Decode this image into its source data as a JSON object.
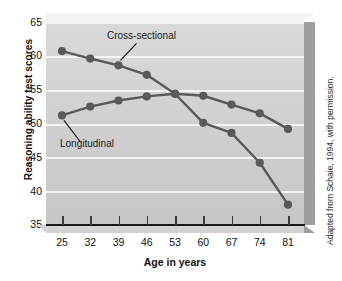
{
  "chart_data": {
    "type": "line",
    "title": "",
    "xlabel": "Age in years",
    "ylabel": "Reasoning ability test scores",
    "x": [
      25,
      32,
      39,
      46,
      53,
      60,
      67,
      74,
      81
    ],
    "xtick_labels": [
      "25",
      "32",
      "39",
      "46",
      "53",
      "60",
      "67",
      "74",
      "81"
    ],
    "ytick_labels": [
      "65",
      "60",
      "55",
      "50",
      "45",
      "40",
      "35"
    ],
    "yticks": [
      65,
      60,
      55,
      50,
      45,
      40,
      35
    ],
    "xlim": [
      25,
      81
    ],
    "ylim": [
      35,
      65
    ],
    "grid": true,
    "legend_position": "inline-annotations",
    "series": [
      {
        "name": "Cross-sectional",
        "values": [
          60.7,
          59.6,
          58.6,
          57.2,
          54.4,
          50.1,
          48.6,
          44.2,
          38.0
        ],
        "color": "#595959",
        "marker": "circle"
      },
      {
        "name": "Longitudinal",
        "values": [
          51.2,
          52.5,
          53.4,
          54.0,
          54.4,
          54.1,
          52.8,
          51.5,
          49.2
        ],
        "color": "#595959",
        "marker": "circle"
      }
    ],
    "annotations": [
      {
        "text": "Cross-sectional",
        "points_to_x": 39,
        "points_to_y": 58.6
      },
      {
        "text": "Longitudinal",
        "points_to_x": 25,
        "points_to_y": 51.2
      }
    ]
  },
  "credit": {
    "text": "Adapted from Schaie, 1994, with permission."
  },
  "colors": {
    "series": "#595959",
    "plot_background": "#d2d2d2",
    "gridline": "#f4f4f4",
    "panel_right": "#9d9d9d",
    "panel_top": "#f2f2f2",
    "axis": "#1a1a1a",
    "text": "#111111"
  }
}
